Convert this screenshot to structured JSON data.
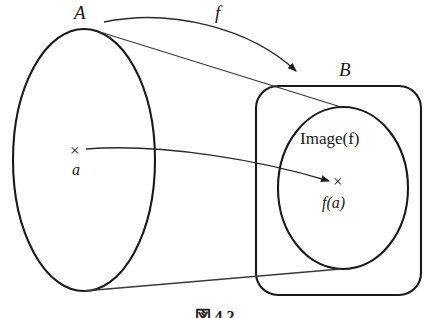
{
  "figure": {
    "domain_set_label": "A",
    "codomain_set_label": "B",
    "function_label": "f",
    "image_label": "Image(f)",
    "element_label": "a",
    "mapped_element_label": "f(a)",
    "caption": "図 4.2",
    "line_color": "#1a1a1a",
    "background_color": "#ffffff",
    "marker_glyph": "×"
  }
}
